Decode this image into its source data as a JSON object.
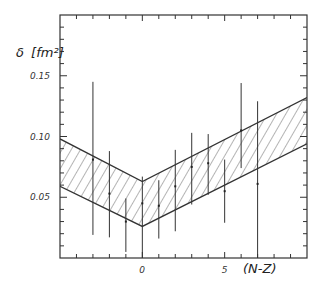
{
  "chart_data": {
    "type": "scatter",
    "title": "",
    "xlabel": "(N-Z)",
    "ylabel": "δ [fm²]",
    "xlim": [
      -5,
      10
    ],
    "ylim": [
      0.0,
      0.2
    ],
    "grid": false,
    "legend": null,
    "x_ticks": [
      {
        "value": 0,
        "label": "0"
      },
      {
        "value": 5,
        "label": "5"
      }
    ],
    "y_ticks": [
      {
        "value": 0.05,
        "label": "0.05"
      },
      {
        "value": 0.1,
        "label": "0.10"
      },
      {
        "value": 0.15,
        "label": "0.15"
      }
    ],
    "series": [
      {
        "name": "data",
        "style": "error-bars",
        "points": [
          {
            "x": -3,
            "y": 0.081,
            "y_low": 0.019,
            "y_high": 0.145
          },
          {
            "x": -2,
            "y": 0.053,
            "y_low": 0.017,
            "y_high": 0.088
          },
          {
            "x": -1,
            "y": 0.03,
            "y_low": 0.005,
            "y_high": 0.049
          },
          {
            "x": 0,
            "y": 0.045,
            "y_low": 0.0,
            "y_high": 0.067
          },
          {
            "x": 1,
            "y": 0.043,
            "y_low": 0.016,
            "y_high": 0.064
          },
          {
            "x": 2,
            "y": 0.059,
            "y_low": 0.022,
            "y_high": 0.089
          },
          {
            "x": 3,
            "y": 0.075,
            "y_low": 0.044,
            "y_high": 0.103
          },
          {
            "x": 4,
            "y": 0.078,
            "y_low": 0.052,
            "y_high": 0.102
          },
          {
            "x": 5,
            "y": 0.055,
            "y_low": 0.029,
            "y_high": 0.081
          },
          {
            "x": 6,
            "y": 0.105,
            "y_low": 0.074,
            "y_high": 0.144
          },
          {
            "x": 7,
            "y": 0.061,
            "y_low": 0.0,
            "y_high": 0.129
          }
        ]
      },
      {
        "name": "band",
        "style": "hatched-band",
        "upper": [
          {
            "x": -5,
            "y": 0.098
          },
          {
            "x": 0,
            "y": 0.063
          },
          {
            "x": 10,
            "y": 0.132
          }
        ],
        "lower": [
          {
            "x": -5,
            "y": 0.059
          },
          {
            "x": 0,
            "y": 0.026
          },
          {
            "x": 10,
            "y": 0.094
          }
        ]
      }
    ]
  },
  "labels": {
    "ylabel_symbol": "δ",
    "ylabel_unit": "[fm²]",
    "xlabel": "(N-Z)"
  }
}
